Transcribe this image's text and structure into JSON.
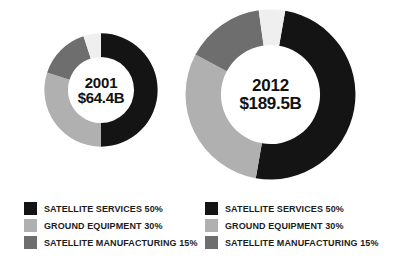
{
  "chart_data": {
    "type": "pie",
    "title": "",
    "subtitle": "",
    "xlabel": "",
    "ylabel": "",
    "legend_position": "bottom",
    "grid": false,
    "variant": "donut",
    "categories": [
      "Satellite Services",
      "Ground Equipment",
      "Satellite Manufacturing",
      "Launch Industry"
    ],
    "charts": [
      {
        "id": "donut-2001",
        "year": "2001",
        "value_label": "$64.4B",
        "center_lines": [
          "2001",
          "$64.4B"
        ],
        "slices": [
          {
            "label": "SATELLITE SERVICES",
            "percent": 50,
            "color": "#141414",
            "start_angle": 0,
            "end_angle": 180
          },
          {
            "label": "GROUND EQUIPMENT",
            "percent": 30,
            "color": "#b0b0b0",
            "start_angle": 180,
            "end_angle": 288
          },
          {
            "label": "SATELLITE MANUFACTURING",
            "percent": 15,
            "color": "#6e6e6e",
            "start_angle": 288,
            "end_angle": 342
          },
          {
            "label": "LAUNCH INDUSTRY",
            "percent": 5,
            "color": "#efefef",
            "start_angle": 342,
            "end_angle": 360
          }
        ]
      },
      {
        "id": "donut-2012",
        "year": "2012",
        "value_label": "$189.5B",
        "center_lines": [
          "2012",
          "$189.5B"
        ],
        "slices": [
          {
            "label": "SATELLITE SERVICES",
            "percent": 50,
            "color": "#141414",
            "start_angle": 10,
            "end_angle": 190
          },
          {
            "label": "GROUND EQUIPMENT",
            "percent": 30,
            "color": "#b0b0b0",
            "start_angle": 190,
            "end_angle": 298
          },
          {
            "label": "SATELLITE MANUFACTURING",
            "percent": 15,
            "color": "#6e6e6e",
            "start_angle": 298,
            "end_angle": 352
          },
          {
            "label": "LAUNCH INDUSTRY",
            "percent": 5,
            "color": "#efefef",
            "start_angle": 352,
            "end_angle": 370
          }
        ]
      }
    ]
  },
  "donuts": {
    "left": {
      "year": "2001",
      "value": "$64.4B"
    },
    "right": {
      "year": "2012",
      "value": "$189.5B"
    }
  },
  "legend_left": {
    "items": [
      {
        "label": "SATELLITE SERVICES 50%",
        "color": "#141414"
      },
      {
        "label": "GROUND EQUIPMENT 30%",
        "color": "#b0b0b0"
      },
      {
        "label": "SATELLITE MANUFACTURING 15%",
        "color": "#6e6e6e"
      }
    ]
  },
  "legend_right": {
    "items": [
      {
        "label": "SATELLITE SERVICES 50%",
        "color": "#141414"
      },
      {
        "label": "GROUND EQUIPMENT 30%",
        "color": "#b0b0b0"
      },
      {
        "label": "SATELLITE MANUFACTURING 15%",
        "color": "#6e6e6e"
      }
    ]
  },
  "colors": {
    "satellite_services": "#141414",
    "ground_equipment": "#b0b0b0",
    "satellite_manufacturing": "#6e6e6e",
    "launch_industry": "#efefef",
    "background": "#ffffff",
    "text": "#1a1a1a"
  }
}
